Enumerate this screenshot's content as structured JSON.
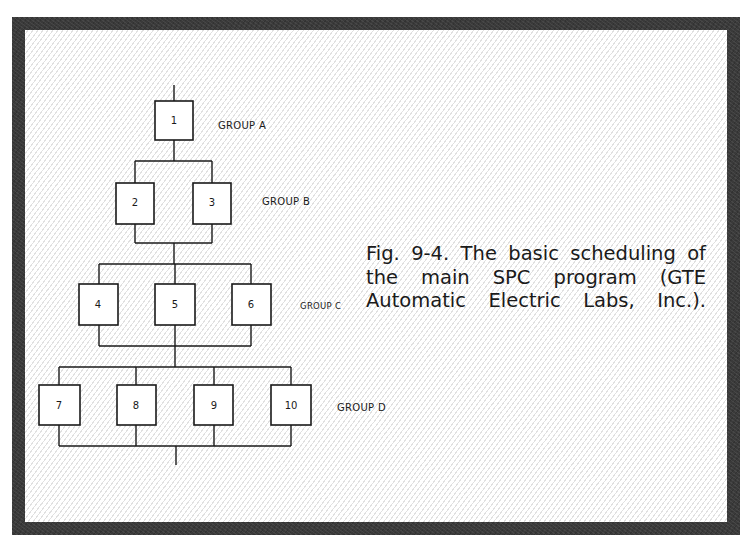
{
  "figure": {
    "caption_lines": [
      "Fig. 9-4. The basic scheduling of",
      "the main SPC program (GTE",
      "Automatic Electric Labs, Inc.)."
    ],
    "caption": "Fig. 9-4. The basic scheduling of the main SPC program (GTE Automatic Electric Labs, Inc.)."
  },
  "diagram": {
    "groups": [
      {
        "label": "GROUP A",
        "boxes": [
          "1"
        ]
      },
      {
        "label": "GROUP B",
        "boxes": [
          "2",
          "3"
        ]
      },
      {
        "label": "GROUP C",
        "boxes": [
          "4",
          "5",
          "6"
        ]
      },
      {
        "label": "GROUP D",
        "boxes": [
          "7",
          "8",
          "9",
          "10"
        ]
      }
    ],
    "colors": {
      "ink": "#1a1a1a",
      "frame": "#3a3a3a",
      "background": "#ffffff"
    }
  }
}
